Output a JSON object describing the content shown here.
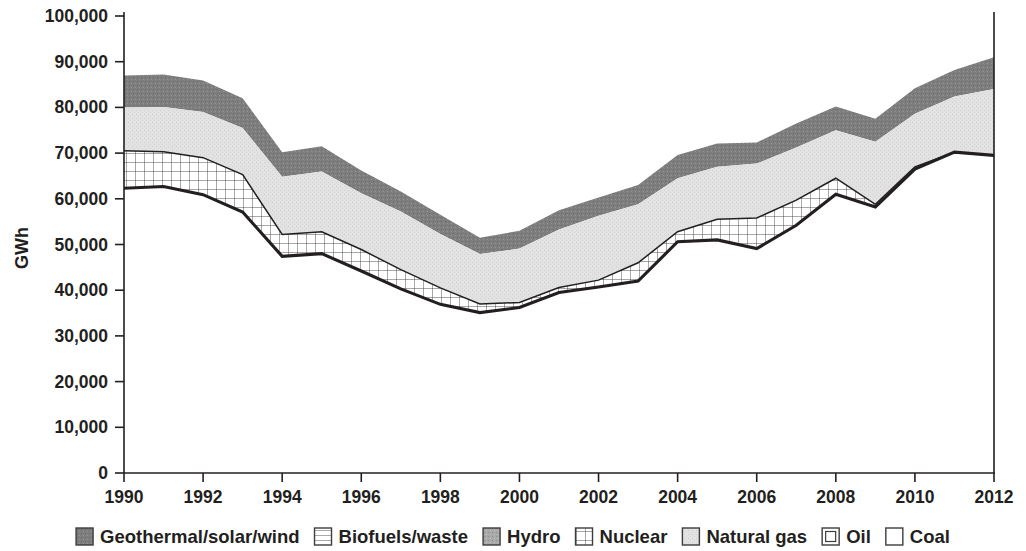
{
  "chart_data": {
    "type": "area",
    "title": "",
    "subtitle": "",
    "xlabel": "",
    "ylabel": "GWh",
    "stacked": true,
    "grid": false,
    "legend_position": "bottom",
    "xlim": [
      1990,
      2012
    ],
    "ylim": [
      0,
      100000
    ],
    "x": [
      1990,
      1991,
      1992,
      1993,
      1994,
      1995,
      1996,
      1997,
      1998,
      1999,
      2000,
      2001,
      2002,
      2003,
      2004,
      2005,
      2006,
      2007,
      2008,
      2009,
      2010,
      2011,
      2012
    ],
    "x_tick_labels": [
      "1990",
      "1992",
      "1994",
      "1996",
      "1998",
      "2000",
      "2002",
      "2004",
      "2006",
      "2008",
      "2010",
      "2012"
    ],
    "y_tick_labels": [
      "0",
      "10,000",
      "20,000",
      "30,000",
      "40,000",
      "50,000",
      "60,000",
      "70,000",
      "80,000",
      "90,000",
      "100,000"
    ],
    "y_ticks": [
      0,
      10000,
      20000,
      30000,
      40000,
      50000,
      60000,
      70000,
      80000,
      90000,
      100000
    ],
    "series": [
      {
        "name": "Coal",
        "pattern": "white",
        "color": "#ffffff",
        "cumulative_top": [
          62300,
          62700,
          60900,
          57100,
          47400,
          48000,
          44200,
          40300,
          36900,
          35100,
          36200,
          39500,
          40700,
          42000,
          50600,
          51000,
          49100,
          54200,
          61000,
          58200,
          66500,
          70200,
          69500
        ]
      },
      {
        "name": "Oil",
        "pattern": "framed-box",
        "color": "#ffffff",
        "cumulative_top": [
          62300,
          62700,
          60900,
          57100,
          47400,
          48000,
          44200,
          40300,
          36900,
          35100,
          36200,
          39500,
          40700,
          42000,
          50600,
          51000,
          49100,
          54200,
          61000,
          58200,
          66500,
          70200,
          69500
        ]
      },
      {
        "name": "Nuclear",
        "pattern": "crosshatch",
        "color": "#ffffff",
        "cumulative_top": [
          70500,
          70300,
          69000,
          65300,
          52200,
          52800,
          48900,
          44500,
          40500,
          37000,
          37300,
          40600,
          42200,
          46000,
          52800,
          55500,
          55800,
          59700,
          64500,
          58800,
          67000,
          70200,
          69500
        ]
      },
      {
        "name": "Natural gas",
        "pattern": "light-stipple",
        "color": "#e3e3e3",
        "cumulative_top": [
          80000,
          80100,
          79000,
          75500,
          64800,
          66000,
          61200,
          57200,
          52300,
          47900,
          49100,
          53300,
          56300,
          58800,
          64500,
          67000,
          67700,
          71200,
          75000,
          72500,
          78600,
          82400,
          84000
        ]
      },
      {
        "name": "Hydro",
        "pattern": "medium-stipple",
        "color": "#a8a8a8",
        "cumulative_top": [
          87000,
          87200,
          85900,
          82000,
          70200,
          71500,
          66200,
          61600,
          56500,
          51500,
          53000,
          57500,
          60300,
          63000,
          69600,
          72100,
          72300,
          76500,
          80200,
          77500,
          84200,
          88200,
          91000
        ]
      },
      {
        "name": "Biofuels/waste",
        "pattern": "horizontal-lines",
        "color": "#ffffff",
        "note": "thin band, rendered within stack"
      },
      {
        "name": "Geothermal/solar/wind",
        "pattern": "dark-solid",
        "color": "#7f7f7f",
        "note": "uppermost band"
      }
    ]
  },
  "axes": {
    "y_title": "GWh",
    "y_labels": [
      "100,000",
      "90,000",
      "80,000",
      "70,000",
      "60,000",
      "50,000",
      "40,000",
      "30,000",
      "20,000",
      "10,000",
      "0"
    ],
    "x_labels": [
      "1990",
      "1992",
      "1994",
      "1996",
      "1998",
      "2000",
      "2002",
      "2004",
      "2006",
      "2008",
      "2010",
      "2012"
    ]
  },
  "legend": {
    "items": [
      {
        "label": "Geothermal/solar/wind",
        "swatch": "dark-solid-swatch",
        "color": "#767676"
      },
      {
        "label": "Biofuels/waste",
        "swatch": "horizontal-lines-swatch",
        "color": "#ffffff"
      },
      {
        "label": "Hydro",
        "swatch": "medium-gray-swatch",
        "color": "#b0b0b0"
      },
      {
        "label": "Nuclear",
        "swatch": "crosshatch-swatch",
        "color": "#ffffff"
      },
      {
        "label": "Natural gas",
        "swatch": "light-gray-swatch",
        "color": "#dcdcdc"
      },
      {
        "label": "Oil",
        "swatch": "framed-box-swatch",
        "color": "#ffffff"
      },
      {
        "label": "Coal",
        "swatch": "white-swatch",
        "color": "#ffffff"
      }
    ]
  }
}
